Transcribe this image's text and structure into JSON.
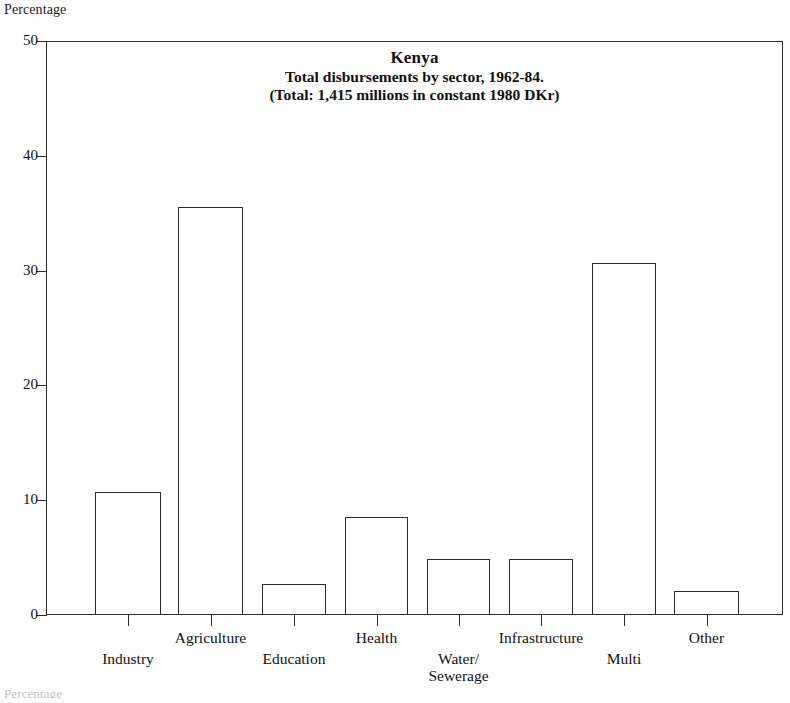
{
  "chart_data": {
    "type": "bar",
    "title": "Kenya",
    "subtitle": "Total disbursements by sector, 1962-84.",
    "subtitle2": "(Total: 1,415 millions in constant 1980 DKr)",
    "ylabel": "Percentage",
    "xlabel": "",
    "categories": [
      "Industry",
      "Agriculture",
      "Education",
      "Health",
      "Water/\nSewerage",
      "Infrastructure",
      "Multi",
      "Other"
    ],
    "values": [
      10.7,
      35.5,
      2.7,
      8.5,
      4.9,
      4.9,
      30.7,
      2.1
    ],
    "ylim": [
      0,
      50
    ],
    "yticks": [
      0,
      10,
      20,
      30,
      40,
      50
    ],
    "ytick_labels": [
      "0",
      "10",
      "20",
      "30",
      "40",
      "50"
    ],
    "grid": false,
    "legend": null,
    "bar_fill": "#ffffff",
    "bar_edge": "#2b2b2b"
  },
  "figure": {
    "y_axis_caption": "Percentage",
    "bottom_note": "Percentage"
  }
}
